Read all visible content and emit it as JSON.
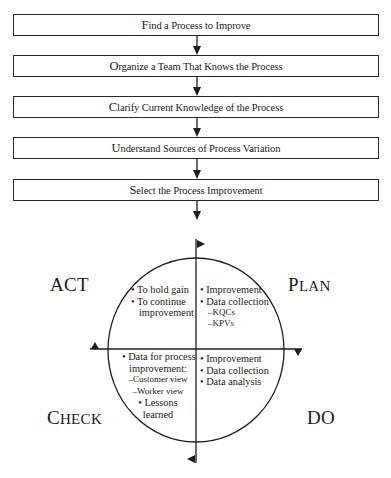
{
  "flow_steps": [
    {
      "label": "Find a Process to Improve"
    },
    {
      "label": "Organize a Team That Knows the Process"
    },
    {
      "label": "Clarify Current Knowledge of the Process"
    },
    {
      "label": "Understand Sources of Process Variation"
    },
    {
      "label": "Select the Process Improvement"
    }
  ],
  "pdca": {
    "act": {
      "title": "ACT",
      "lines": [
        "• To hold gain",
        "• To continue",
        "improvement"
      ]
    },
    "plan": {
      "title": "PLAN",
      "lines": [
        "• Improvement",
        "• Data collection",
        "–KQCs",
        "–KPVs"
      ]
    },
    "check": {
      "title": "CHECK",
      "lines": [
        "• Data for process",
        "improvement:",
        "–Customer view",
        "–Worker view",
        "• Lessons",
        "learned"
      ]
    },
    "do": {
      "title": "DO",
      "lines": [
        "• Improvement",
        "• Data collection",
        "• Data analysis"
      ]
    }
  },
  "colors": {
    "line": "#1e1e1e",
    "background": "#ffffff"
  }
}
